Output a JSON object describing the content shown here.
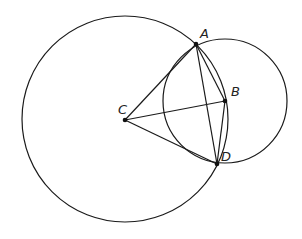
{
  "diagram": {
    "type": "geometry",
    "circles": [
      {
        "name": "circle-centered-C",
        "center": "C",
        "cx": 125,
        "cy": 119,
        "r": 103
      },
      {
        "name": "circle-centered-B",
        "center": "B",
        "cx": 225,
        "cy": 101,
        "r": 62
      }
    ],
    "points": {
      "A": {
        "label": "A",
        "x": 196,
        "y": 44,
        "lx": 200,
        "ly": 38
      },
      "B": {
        "label": "B",
        "x": 225,
        "y": 101,
        "lx": 231,
        "ly": 96
      },
      "C": {
        "label": "C",
        "x": 125,
        "y": 120,
        "lx": 118,
        "ly": 114
      },
      "D": {
        "label": "D",
        "x": 217,
        "y": 164,
        "lx": 221,
        "ly": 161
      }
    },
    "segments": [
      [
        "C",
        "A"
      ],
      [
        "C",
        "B"
      ],
      [
        "C",
        "D"
      ],
      [
        "A",
        "B"
      ],
      [
        "B",
        "D"
      ],
      [
        "A",
        "D"
      ]
    ]
  }
}
